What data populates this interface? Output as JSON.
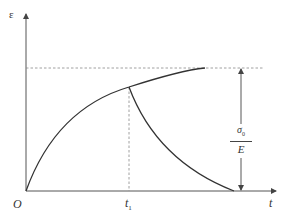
{
  "diagram": {
    "type": "strain-time creep recovery curve",
    "colors": {
      "axis": "#555555",
      "curve": "#333333",
      "dashed": "#888888",
      "text": "#333333",
      "background": "#ffffff"
    },
    "labels": {
      "y_axis": "ε",
      "origin": "O",
      "t1_main": "t",
      "t1_sub": "1",
      "x_axis": "t",
      "fraction_numerator_main": "σ",
      "fraction_numerator_sub": "0",
      "fraction_denominator": "E"
    },
    "elements": {
      "rising_curve": "creep strain curve from origin approaching asymptote",
      "recovery_curve": "strain recovery curve from t1 down to zero",
      "asymptote": "horizontal dashed line at ε = σ0/E",
      "t1_marker": "vertical dashed line at t1",
      "dimension_arrow": "double-headed vertical arrow indicating σ0/E"
    }
  }
}
